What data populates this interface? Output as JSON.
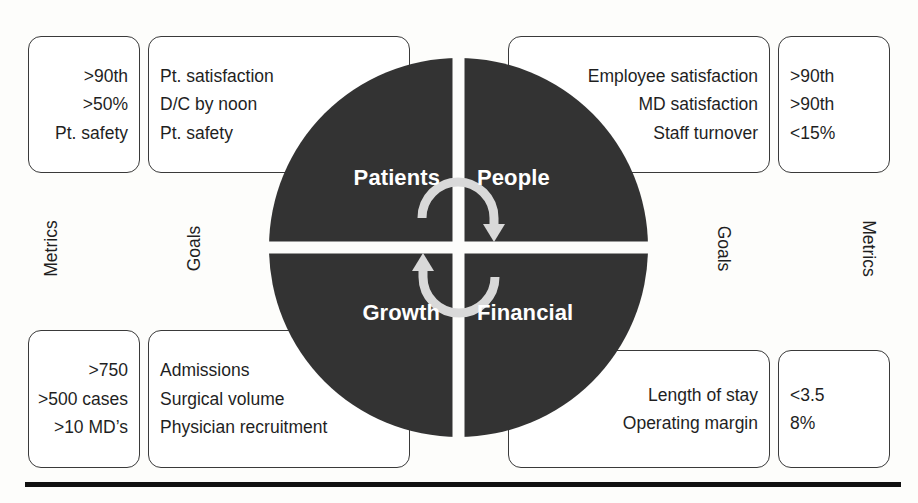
{
  "diagram": {
    "circle_fill": "#333333",
    "arrow_color": "#d9d9d9",
    "quadrant_label_color": "#ffffff",
    "box_border_color": "#3a3a3a",
    "rule_color": "#111111"
  },
  "captions": {
    "metrics_left": "Metrics",
    "goals_left": "Goals",
    "goals_right": "Goals",
    "metrics_right": "Metrics"
  },
  "quadrants": {
    "patients": {
      "label": "Patients",
      "metrics": [
        ">90th",
        ">50%",
        "Pt. safety"
      ],
      "goals": [
        "Pt. satisfaction",
        "D/C by noon",
        "Pt. safety"
      ]
    },
    "people": {
      "label": "People",
      "goals": [
        "Employee satisfaction",
        "MD satisfaction",
        "Staff turnover"
      ],
      "metrics": [
        ">90th",
        ">90th",
        "<15%"
      ]
    },
    "growth": {
      "label": "Growth",
      "metrics": [
        ">750",
        ">500 cases",
        ">10 MD’s"
      ],
      "goals": [
        "Admissions",
        "Surgical volume",
        "Physician recruitment"
      ]
    },
    "financial": {
      "label": "Financial",
      "goals": [
        "Length of stay",
        "Operating margin"
      ],
      "metrics": [
        "<3.5",
        "8%"
      ]
    }
  },
  "icons": {
    "cycle": "cycle-arrows-icon"
  }
}
